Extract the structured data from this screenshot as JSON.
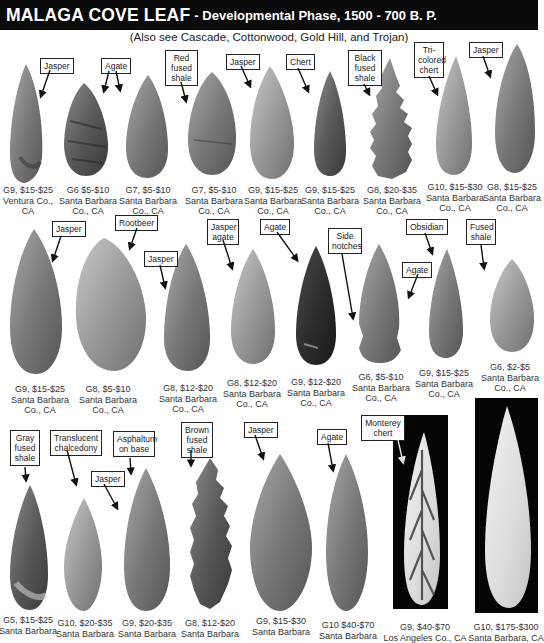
{
  "header": {
    "title": "MALAGA COVE LEAF",
    "subtitle_inline": "- Developmental Phase, 1500 - 700 B. P.",
    "see_also": "(Also see Cascade, Cottonwood, Gold Hill, and Trojan)"
  },
  "colors": {
    "title_bar_bg": "#0a0a0a",
    "title_text": "#ffffff",
    "page_bg": "#ffffff"
  },
  "rows": [
    {
      "points": [
        {
          "grade_value": "G9, $15-$25",
          "location1": "Ventura Co.,",
          "location2": "CA",
          "material": "Jasper"
        },
        {
          "grade_value": "G6 $5-$10",
          "location1": "Santa Barbara",
          "location2": "Co., CA",
          "material": "Agate"
        },
        {
          "grade_value": "G7, $5-$10",
          "location1": "Santa Barbara",
          "location2": "Co., CA",
          "material": ""
        },
        {
          "grade_value": "G7, $5-$10",
          "location1": "Santa Barbara",
          "location2": "Co., CA",
          "material": "Red fused shale"
        },
        {
          "grade_value": "G9, $15-$25",
          "location1": "Santa Barbara",
          "location2": "Co., CA",
          "material": "Jasper"
        },
        {
          "grade_value": "G9, $15-$25",
          "location1": "Santa Barbara",
          "location2": "Co., CA",
          "material": "Chert"
        },
        {
          "grade_value": "G8, $20-$35",
          "location1": "Santa Barbara",
          "location2": "Co., CA",
          "material": "Black fused shale"
        },
        {
          "grade_value": "G10, $15-$30",
          "location1": "Santa Barbara",
          "location2": "Co., CA",
          "material": "Tri-colored chert"
        },
        {
          "grade_value": "G8, $15-$25",
          "location1": "Santa Barbara",
          "location2": "Co., CA",
          "material": "Jasper"
        }
      ]
    },
    {
      "points": [
        {
          "grade_value": "G9, $15-$25",
          "location1": "Santa Barbara",
          "location2": "Co., CA",
          "material": "Jasper"
        },
        {
          "grade_value": "G8, $5-$10",
          "location1": "Santa Barbara",
          "location2": "Co., CA",
          "material": "Rootbeer"
        },
        {
          "grade_value": "G8, $12-$20",
          "location1": "Santa Barbara",
          "location2": "Co., CA",
          "material": "Jasper"
        },
        {
          "grade_value": "G8, $12-$20",
          "location1": "Santa Barbara",
          "location2": "Co., CA",
          "material": "Jasper agate"
        },
        {
          "grade_value": "G9, $12-$20",
          "location1": "Santa Barbara",
          "location2": "Co., CA",
          "material": "Agate"
        },
        {
          "grade_value": "G6, $5-$10",
          "location1": "Santa Barbara",
          "location2": "Co., CA",
          "material": "Side notches"
        },
        {
          "grade_value": "G9, $15-$25",
          "location1": "Santa Barbara",
          "location2": "Co., CA",
          "material": "Obsidian"
        },
        {
          "grade_value": "G6, $2-$5",
          "location1": "Santa Barbara",
          "location2": "Co., CA",
          "material": "Fused shale"
        }
      ],
      "extra_labels": [
        "Agate"
      ]
    },
    {
      "points": [
        {
          "grade_value": "G5, $15-$25",
          "location1": "Santa Barbara",
          "material": "Gray fused shale"
        },
        {
          "grade_value": "G10, $20-$35",
          "location1": "Santa Barbara",
          "material": "Translucent chalcedony"
        },
        {
          "grade_value": "G9, $20-$35",
          "location1": "Santa Barbara",
          "material": "Asphaltum on base"
        },
        {
          "grade_value": "G8, $12-$20",
          "location1": "Santa Barbara",
          "material": "Brown fused shale"
        },
        {
          "grade_value": "G9, $15-$30",
          "location1": "Santa Barbara",
          "material": "Jasper"
        },
        {
          "grade_value": "G10 $40-$70",
          "location1": "Santa Barbara",
          "material": "Agate"
        },
        {
          "grade_value": "G9, $40-$70",
          "location1": "Los Angeles Co., CA",
          "material": "Monterey chert"
        },
        {
          "grade_value": "G10, $175-$300",
          "location1": "Santa Barbara, CA",
          "material": ""
        }
      ],
      "extra_labels": [
        "Jasper"
      ]
    }
  ]
}
